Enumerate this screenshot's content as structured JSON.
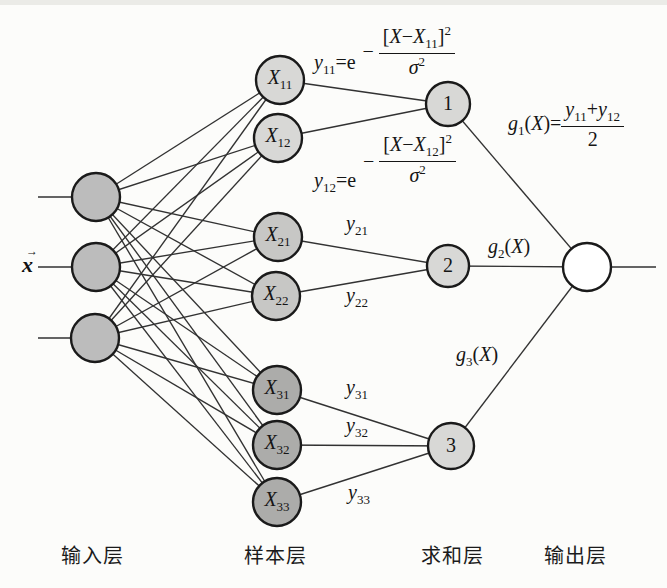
{
  "colors": {
    "node_stroke": "#1a1a1a",
    "line": "#323232",
    "input_fill": "#bcbcbc",
    "sample_row1_fill": "#d8d8d6",
    "sample_row2_fill": "#c7c7c5",
    "sample_row3_fill": "#acacaa",
    "sum_fill": "#d8d8d6",
    "output_fill": "#ffffff"
  },
  "input_vector": {
    "base": "x",
    "arrow": "→",
    "x": 22,
    "y": 252
  },
  "nodes": {
    "input": [
      {
        "x": 96,
        "y": 197,
        "r": 24
      },
      {
        "x": 96,
        "y": 267,
        "r": 24
      },
      {
        "x": 95,
        "y": 338,
        "r": 24
      }
    ],
    "sample": [
      {
        "base": "X",
        "sub": "11",
        "x": 280,
        "y": 80,
        "r": 24,
        "fill": "sample_row1_fill"
      },
      {
        "base": "X",
        "sub": "12",
        "x": 278,
        "y": 138,
        "r": 24,
        "fill": "sample_row1_fill"
      },
      {
        "base": "X",
        "sub": "21",
        "x": 278,
        "y": 237,
        "r": 24,
        "fill": "sample_row2_fill"
      },
      {
        "base": "X",
        "sub": "22",
        "x": 276,
        "y": 296,
        "r": 24,
        "fill": "sample_row2_fill"
      },
      {
        "base": "X",
        "sub": "31",
        "x": 277,
        "y": 390,
        "r": 24,
        "fill": "sample_row3_fill"
      },
      {
        "base": "X",
        "sub": "32",
        "x": 277,
        "y": 445,
        "r": 24,
        "fill": "sample_row3_fill"
      },
      {
        "base": "X",
        "sub": "33",
        "x": 277,
        "y": 502,
        "r": 24,
        "fill": "sample_row3_fill"
      }
    ],
    "sum": [
      {
        "label": "1",
        "x": 448,
        "y": 104,
        "r": 22
      },
      {
        "label": "2",
        "x": 448,
        "y": 266,
        "r": 21
      },
      {
        "label": "3",
        "x": 451,
        "y": 446,
        "r": 23
      }
    ],
    "output": {
      "x": 587,
      "y": 267,
      "r": 24
    }
  },
  "edges": {
    "stubs": [
      {
        "x1": 38,
        "y1": 197,
        "x2": 76,
        "y2": 197
      },
      {
        "x1": 38,
        "y1": 267,
        "x2": 76,
        "y2": 267
      },
      {
        "x1": 38,
        "y1": 338,
        "x2": 75,
        "y2": 338
      },
      {
        "x1": 610,
        "y1": 267,
        "x2": 656,
        "y2": 267
      }
    ],
    "input_to_sample": "full",
    "sample_to_sum": [
      [
        0,
        0
      ],
      [
        1,
        0
      ],
      [
        2,
        1
      ],
      [
        3,
        1
      ],
      [
        4,
        2
      ],
      [
        5,
        2
      ],
      [
        6,
        2
      ]
    ],
    "sum_to_output": [
      0,
      1,
      2
    ]
  },
  "edge_labels": [
    {
      "name": "edge-label-y21",
      "base": "y",
      "sub": "21",
      "x": 346,
      "y": 213
    },
    {
      "name": "edge-label-y22",
      "base": "y",
      "sub": "22",
      "x": 346,
      "y": 285
    },
    {
      "name": "edge-label-y31",
      "base": "y",
      "sub": "31",
      "x": 346,
      "y": 377
    },
    {
      "name": "edge-label-y32",
      "base": "y",
      "sub": "32",
      "x": 346,
      "y": 415
    },
    {
      "name": "edge-label-y33",
      "base": "y",
      "sub": "33",
      "x": 348,
      "y": 482
    }
  ],
  "formulas": {
    "y11": {
      "lhs_base": "y",
      "lhs_sub": "11",
      "eq": "=e",
      "minus": "−",
      "num_open": "[",
      "num_x1": "X",
      "num_minus": "−",
      "num_x2": "X",
      "num_sub": "11",
      "num_close": "]",
      "num_sup": "2",
      "den_base": "σ",
      "den_sup": "2"
    },
    "y12": {
      "lhs_base": "y",
      "lhs_sub": "12",
      "eq": "=e",
      "minus": "−",
      "num_open": "[",
      "num_x1": "X",
      "num_minus": "−",
      "num_x2": "X",
      "num_sub": "12",
      "num_close": "]",
      "num_sup": "2",
      "den_base": "σ",
      "den_sup": "2"
    },
    "g1": {
      "lhs_base": "g",
      "lhs_sub": "1",
      "open": "(",
      "var": "X",
      "close": ")=",
      "num_a": "y",
      "num_a_sub": "11",
      "plus": "+",
      "num_b": "y",
      "num_b_sub": "12",
      "den": "2"
    },
    "g2": {
      "base": "g",
      "sub": "2",
      "open": "(",
      "var": "X",
      "close": ")",
      "x": 488,
      "y": 236
    },
    "g3": {
      "base": "g",
      "sub": "3",
      "open": "(",
      "var": "X",
      "close": ")",
      "x": 456,
      "y": 344
    }
  },
  "layer_labels": [
    {
      "name": "input-layer-label",
      "text": "输入层",
      "x": 92,
      "y": 554
    },
    {
      "name": "sample-layer-label",
      "text": "样本层",
      "x": 275,
      "y": 554
    },
    {
      "name": "sum-layer-label",
      "text": "求和层",
      "x": 452,
      "y": 554
    },
    {
      "name": "output-layer-label",
      "text": "输出层",
      "x": 575,
      "y": 554
    }
  ]
}
